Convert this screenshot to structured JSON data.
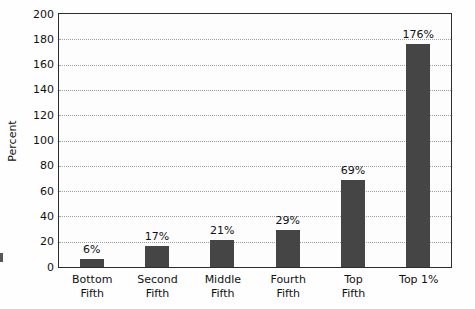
{
  "chart_data": {
    "type": "bar",
    "title": "",
    "xlabel": "",
    "ylabel": "Percent",
    "categories": [
      "Bottom\nFifth",
      "Second\nFifth",
      "Middle\nFifth",
      "Fourth\nFifth",
      "Top\nFifth",
      "Top 1%"
    ],
    "values": [
      6,
      17,
      21,
      29,
      69,
      176
    ],
    "bar_labels": [
      "6%",
      "17%",
      "21%",
      "29%",
      "69%",
      "176%"
    ],
    "ylim": [
      0,
      200
    ],
    "ytick_step": 20,
    "yticks": [
      0,
      20,
      40,
      60,
      80,
      100,
      120,
      140,
      160,
      180,
      200
    ],
    "grid": "horizontal-dotted",
    "legend": "none",
    "colors": {
      "bar": "#454545",
      "frame": "#2d2d2d",
      "gridline": "#a0a0a0",
      "text": "#111111",
      "background": "#fefefe"
    }
  }
}
